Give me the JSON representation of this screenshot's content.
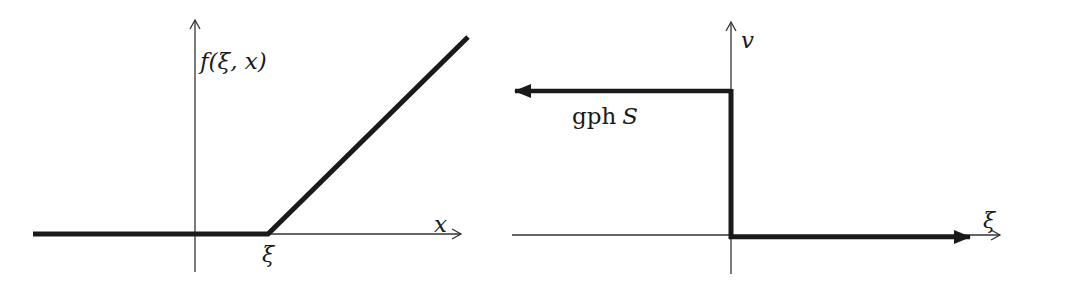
{
  "left_panel": {
    "y_axis_label": "f(ξ, x)",
    "x_axis_label": "x",
    "kink_label": "ξ",
    "description": "Piecewise linear function: zero for x ≤ ξ, linear increasing for x > ξ"
  },
  "right_panel": {
    "y_axis_label": "v",
    "x_axis_label": "ξ",
    "graph_label_upright": "gph",
    "graph_label_italic": "S",
    "description": "Step set-valued map: constant level left of origin, vertical jump at origin, zero for positive ξ"
  },
  "colors": {
    "stroke": "#1a1a1a",
    "axis": "#333333",
    "background": "#ffffff"
  }
}
